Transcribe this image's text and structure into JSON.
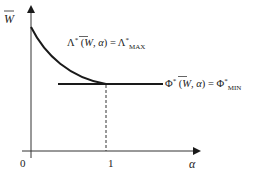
{
  "diagram": {
    "y_axis_label": "W",
    "x_axis_label": "α",
    "x_ticks": [
      "0",
      "1"
    ],
    "curve_label": {
      "lhs_symbol": "Λ",
      "sup": "*",
      "args_open": " (",
      "args_W": "W",
      "args_sep": ", ",
      "args_alpha": "α",
      "args_close": ") = ",
      "rhs_symbol": "Λ",
      "rhs_sup": "*",
      "rhs_sub": "MAX"
    },
    "line_label": {
      "lhs_symbol": "Φ",
      "sup": "*",
      "args_open": " (",
      "args_W": "W",
      "args_sep": ", ",
      "args_alpha": "α",
      "args_close": ") = ",
      "rhs_symbol": "Φ",
      "rhs_sup": "*",
      "rhs_sub": "MIN"
    },
    "colors": {
      "axis": "#333333",
      "curve": "#1a1a1a",
      "text": "#222222"
    }
  }
}
